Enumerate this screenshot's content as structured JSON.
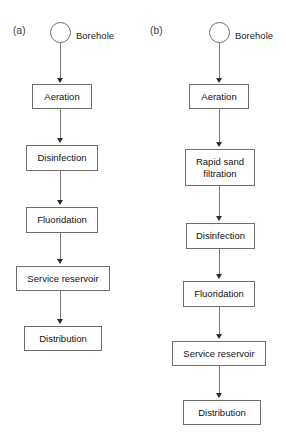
{
  "figure": {
    "background_color": "#ffffff",
    "box_border_color": "#6e6e6e",
    "line_color": "#7a7a7a",
    "arrow_color": "#2b2b2b",
    "text_color": "#111111"
  },
  "panels": [
    {
      "id": "panel-a",
      "label": "(a)",
      "source_label": "Borehole",
      "source_shape": "circle",
      "steps": [
        {
          "label": "Aeration"
        },
        {
          "label": "Disinfection"
        },
        {
          "label": "Fluoridation"
        },
        {
          "label": "Service reservoir"
        },
        {
          "label": "Distribution"
        }
      ]
    },
    {
      "id": "panel-b",
      "label": "(b)",
      "source_label": "Borehole",
      "source_shape": "circle",
      "steps": [
        {
          "label": "Aeration"
        },
        {
          "label": "Rapid sand\nfiltration",
          "line1": "Rapid sand",
          "line2": "filtration"
        },
        {
          "label": "Disinfection"
        },
        {
          "label": "Fluoridation"
        },
        {
          "label": "Service reservoir"
        },
        {
          "label": "Distribution"
        }
      ]
    }
  ]
}
